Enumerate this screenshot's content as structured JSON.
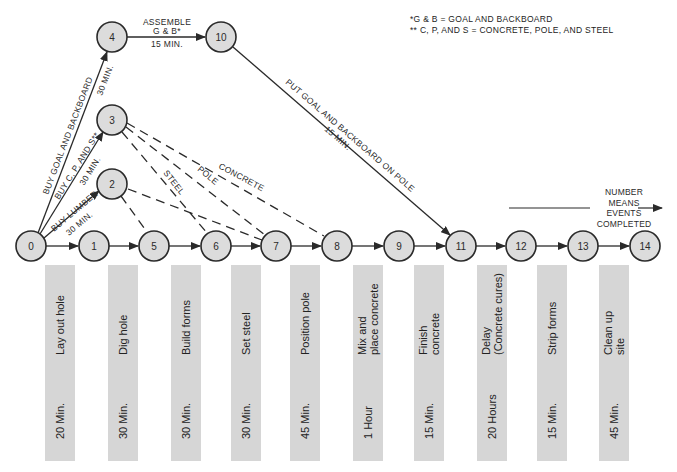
{
  "legend": {
    "line1": "*G & B = GOAL AND BACKBOARD",
    "line2": "** C, P, AND S = CONCRETE, POLE, AND STEEL"
  },
  "direction_note": {
    "line1": "NUMBER",
    "line2": "MEANS",
    "line3": "EVENTS",
    "line4": "COMPLETED"
  },
  "nodes": [
    {
      "id": "0",
      "label": "0"
    },
    {
      "id": "1",
      "label": "1"
    },
    {
      "id": "2",
      "label": "2"
    },
    {
      "id": "3",
      "label": "3"
    },
    {
      "id": "4",
      "label": "4"
    },
    {
      "id": "5",
      "label": "5"
    },
    {
      "id": "6",
      "label": "6"
    },
    {
      "id": "7",
      "label": "7"
    },
    {
      "id": "8",
      "label": "8"
    },
    {
      "id": "9",
      "label": "9"
    },
    {
      "id": "10",
      "label": "10"
    },
    {
      "id": "11",
      "label": "11"
    },
    {
      "id": "12",
      "label": "12"
    },
    {
      "id": "13",
      "label": "13"
    },
    {
      "id": "14",
      "label": "14"
    }
  ],
  "edge_labels": {
    "buy_goal": "BUY GOAL AND BACKBOARD",
    "buy_goal_time": "30 MIN.",
    "buy_cps": "BUY C, P, AND S**",
    "buy_cps_time": "30 MIN.",
    "buy_lumber": "BUY LUMBER",
    "buy_lumber_time": "30 MIN.",
    "assemble_1": "ASSEMBLE",
    "assemble_2": "G & B*",
    "assemble_time": "15 MIN.",
    "put_goal": "PUT GOAL AND BACKBOARD ON POLE",
    "put_goal_time": "15 MIN.",
    "steel": "STEEL",
    "pole": "POLE",
    "concrete": "CONCRETE"
  },
  "activities": [
    {
      "activity": "Lay out hole",
      "duration": "20 Min."
    },
    {
      "activity": "Dig hole",
      "duration": "30 Min."
    },
    {
      "activity": "Build forms",
      "duration": "30 Min."
    },
    {
      "activity": "Set steel",
      "duration": "30 Min."
    },
    {
      "activity": "Position pole",
      "duration": "45 Min."
    },
    {
      "activity": "Mix and\nplace concrete",
      "duration": "1 Hour"
    },
    {
      "activity": "Finish\nconcrete",
      "duration": "15 Min."
    },
    {
      "activity": "Delay\n(Concrete cures)",
      "duration": "20 Hours"
    },
    {
      "activity": "Strip forms",
      "duration": "15 Min."
    },
    {
      "activity": "Clean up\nsite",
      "duration": "45 Min."
    }
  ],
  "colors": {
    "node_fill": "#dcdcdc",
    "bar_fill": "#d6d6d6",
    "line": "#2a2a2a"
  }
}
